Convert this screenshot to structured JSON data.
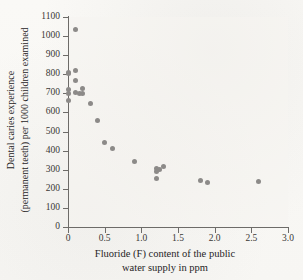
{
  "chart_data": {
    "type": "scatter",
    "title": "",
    "xlabel": "Fluoride (F) content of the public water supply in ppm",
    "xlabel_line1": "Fluoride (F) content of the public",
    "xlabel_line2": "water supply in ppm",
    "ylabel": "Dental caries experience (permanent teeth) per 1000 children examined",
    "ylabel_line1": "Dental caries experience",
    "ylabel_line2": "(permanent teeth) per 1000 children examined",
    "xlim": [
      0,
      3.0
    ],
    "ylim": [
      0,
      1100
    ],
    "xticks": [
      0,
      0.5,
      1.0,
      1.5,
      2.0,
      2.5,
      3.0
    ],
    "xtick_labels": [
      "0",
      "0.5",
      "1.0",
      "1.5",
      "2.0",
      "2.5",
      "3.0"
    ],
    "yticks": [
      0,
      100,
      200,
      300,
      400,
      500,
      600,
      700,
      800,
      900,
      1000,
      1100
    ],
    "ytick_labels": [
      "0",
      "100",
      "200",
      "300",
      "400",
      "500",
      "600",
      "700",
      "800",
      "900",
      "1000",
      "1100"
    ],
    "grid": false,
    "legend": false,
    "marker_color": "#8c8a88",
    "axis_color": "#6d6b68",
    "background_color": "#fcfbf8",
    "points": [
      {
        "x": 0.0,
        "y": 810
      },
      {
        "x": 0.0,
        "y": 805
      },
      {
        "x": 0.0,
        "y": 722
      },
      {
        "x": 0.0,
        "y": 700
      },
      {
        "x": 0.0,
        "y": 665
      },
      {
        "x": 0.1,
        "y": 1032
      },
      {
        "x": 0.1,
        "y": 820
      },
      {
        "x": 0.1,
        "y": 765
      },
      {
        "x": 0.1,
        "y": 702
      },
      {
        "x": 0.15,
        "y": 700
      },
      {
        "x": 0.2,
        "y": 728
      },
      {
        "x": 0.2,
        "y": 700
      },
      {
        "x": 0.3,
        "y": 647
      },
      {
        "x": 0.4,
        "y": 557
      },
      {
        "x": 0.5,
        "y": 445
      },
      {
        "x": 0.6,
        "y": 413
      },
      {
        "x": 0.9,
        "y": 342
      },
      {
        "x": 1.2,
        "y": 305
      },
      {
        "x": 1.2,
        "y": 293
      },
      {
        "x": 1.2,
        "y": 253
      },
      {
        "x": 1.25,
        "y": 300
      },
      {
        "x": 1.3,
        "y": 318
      },
      {
        "x": 1.8,
        "y": 243
      },
      {
        "x": 1.9,
        "y": 232
      },
      {
        "x": 2.6,
        "y": 238
      }
    ]
  }
}
